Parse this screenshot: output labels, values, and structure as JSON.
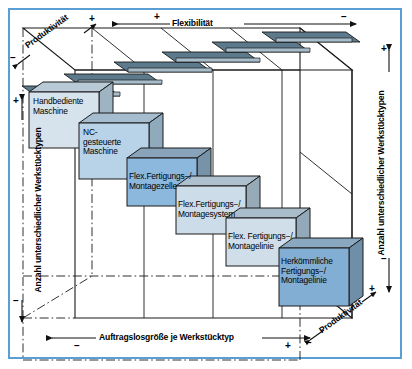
{
  "figure": {
    "title_visible": false,
    "frame_color": "#5a9fd4"
  },
  "axes": {
    "top": {
      "label": "Flexibilität",
      "plus": "+",
      "minus": "−",
      "direction": "left-to-right"
    },
    "bottom": {
      "label": "Auftragslosgröße je Werkstücktyp",
      "minus": "−",
      "plus": "+",
      "direction": "left-to-right"
    },
    "left": {
      "label": "Anzahl unterschiedlicher  Werkstücktypen",
      "plus": "+",
      "minus": "−",
      "direction": "top-to-bottom"
    },
    "right": {
      "label": "Anzahl unterschiedlicher Werkstücktypen",
      "plus": "+",
      "minus": "−",
      "direction": "top-to-bottom"
    },
    "depth_top_left": {
      "label": "Produktivität",
      "minus": "−",
      "plus": "+"
    },
    "depth_bottom_right": {
      "label": "Produktivität",
      "minus": "−",
      "plus": "+"
    }
  },
  "blocks": [
    {
      "id": "handbediente-maschine",
      "lines": [
        "Handbediente",
        "Maschine"
      ],
      "face_color": "#d7e3ec",
      "side_color": "#9fb4c2",
      "top_color": "#b9cad7"
    },
    {
      "id": "nc-gesteuerte-maschine",
      "lines": [
        "NC-",
        "gesteuerte",
        "Maschine"
      ],
      "face_color": "#b8d2e8",
      "side_color": "#8fa9bd",
      "top_color": "#a6bdd0"
    },
    {
      "id": "flex-fertigungs-montagezelle",
      "lines": [
        "Flex.Fertigungs−/",
        "Montagezelle"
      ],
      "face_color": "#8cb8dd",
      "side_color": "#7693a8",
      "top_color": "#89a4ba"
    },
    {
      "id": "flex-fertigungs-montagesystem",
      "lines": [
        "Flex.Fertigungs−/",
        "Montagesystem"
      ],
      "face_color": "#ccdce8",
      "side_color": "#97aab8",
      "top_color": "#aec0cd"
    },
    {
      "id": "flex-fertigungs-montagelinie",
      "lines": [
        "Flex. Fertigungs−/",
        "Montagelinie"
      ],
      "face_color": "#cfdee9",
      "side_color": "#93a8b8",
      "top_color": "#a9bcca"
    },
    {
      "id": "herkoemmliche-fertigungs-montagelinie",
      "lines": [
        "Herkömmliche",
        "Fertigungs−/",
        "Montagelinie"
      ],
      "face_color": "#83aed4",
      "side_color": "#6f8fa8",
      "top_color": "#8aa8c0"
    }
  ],
  "colors": {
    "line": "#1a1a1a",
    "frame": "#5a9fd4",
    "plate_dark": "#5d7a8c",
    "plate_light": "#b9cdd9"
  }
}
